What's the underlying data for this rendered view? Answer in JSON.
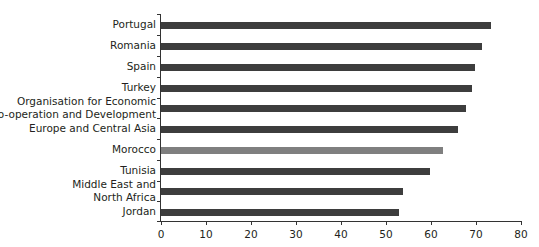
{
  "chart_data": {
    "type": "bar",
    "orientation": "horizontal",
    "title": "",
    "xlabel": "",
    "ylabel": "",
    "xlim": [
      0,
      80
    ],
    "xticks": [
      0,
      10,
      20,
      30,
      40,
      50,
      60,
      70,
      80
    ],
    "grid": false,
    "legend": null,
    "categories": [
      "Portugal",
      "Romania",
      "Spain",
      "Turkey",
      "Organisation for Economic Co-operation and Development",
      "Europe and Central Asia",
      "Morocco",
      "Tunisia",
      "Middle East and North Africa",
      "Jordan"
    ],
    "values": [
      73.3,
      71.3,
      69.8,
      69.1,
      67.8,
      66.0,
      62.7,
      59.8,
      53.8,
      52.9
    ],
    "colors": [
      "#3d3d3d",
      "#3d3d3d",
      "#3d3d3d",
      "#3d3d3d",
      "#3d3d3d",
      "#3d3d3d",
      "#7f7f7f",
      "#3d3d3d",
      "#3d3d3d",
      "#3d3d3d"
    ],
    "highlight": "Morocco"
  },
  "labels": {
    "portugal": "Portugal",
    "romania": "Romania",
    "spain": "Spain",
    "turkey": "Turkey",
    "oecd_line1": "Organisation for Economic",
    "oecd_line2": "Co-operation and Development",
    "eca": "Europe and Central Asia",
    "morocco": "Morocco",
    "tunisia": "Tunisia",
    "mena_line1": "Middle East and",
    "mena_line2": "North Africa",
    "jordan": "Jordan"
  },
  "axis": {
    "t0": "0",
    "t10": "10",
    "t20": "20",
    "t30": "30",
    "t40": "40",
    "t50": "50",
    "t60": "60",
    "t70": "70",
    "t80": "80"
  }
}
